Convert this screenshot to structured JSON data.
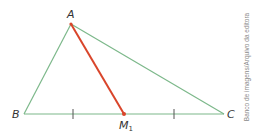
{
  "diagram": {
    "type": "triangle-median",
    "colors": {
      "triangle": "#7cb88a",
      "median": "#d9452b",
      "label": "#333333",
      "credit": "#8a8a8a"
    },
    "points": {
      "A": {
        "label": "A",
        "x": 71,
        "y": 24
      },
      "B": {
        "label": "B",
        "x": 24,
        "y": 114
      },
      "C": {
        "label": "C",
        "x": 224,
        "y": 114
      },
      "M1": {
        "label": "M",
        "subscript": "1",
        "x": 124,
        "y": 114
      }
    },
    "tick_marks": [
      {
        "x": 73,
        "y": 114
      },
      {
        "x": 174,
        "y": 114
      }
    ],
    "median": {
      "from": "A",
      "to": "M1"
    }
  },
  "credit": "Banco de imagens/Arquivo da editora"
}
